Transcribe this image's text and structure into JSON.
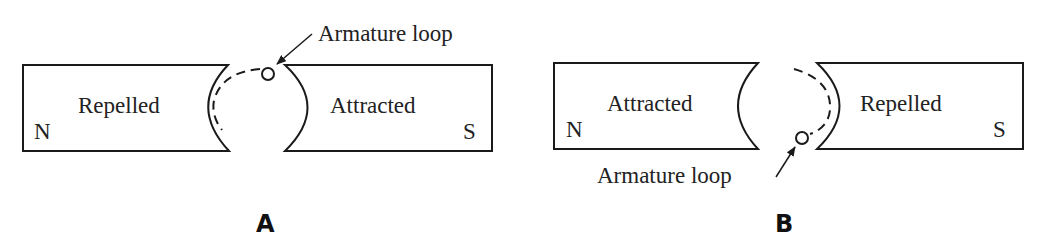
{
  "figures": [
    {
      "id": "A",
      "caption": "A",
      "left_magnet": {
        "pole": "N",
        "label": "Repelled"
      },
      "right_magnet": {
        "pole": "S",
        "label": "Attracted"
      },
      "armature_label": "Armature loop",
      "armature_position": "top"
    },
    {
      "id": "B",
      "caption": "B",
      "left_magnet": {
        "pole": "N",
        "label": "Attracted"
      },
      "right_magnet": {
        "pole": "S",
        "label": "Repelled"
      },
      "armature_label": "Armature loop",
      "armature_position": "bottom"
    }
  ],
  "colors": {
    "line": "#1a1a1a",
    "background": "#ffffff"
  }
}
